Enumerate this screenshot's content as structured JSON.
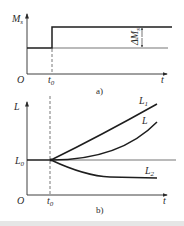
{
  "figure_a": {
    "caption": "a)",
    "y_label": "M",
    "y_label_sub": "s",
    "origin_label": "O",
    "x_tick_label": "t",
    "x_tick_sub": "0",
    "x_axis_label": "t",
    "delta_label": "ΔM",
    "delta_sub": "s"
  },
  "figure_b": {
    "caption": "b)",
    "y_label": "L",
    "origin_label": "O",
    "x_tick_label": "t",
    "x_tick_sub": "0",
    "x_axis_label": "t",
    "level_label": "L",
    "level_sub": "0",
    "curves": [
      {
        "label": "L",
        "sub": "1",
        "trend": "rising-fast"
      },
      {
        "label": "L",
        "sub": "",
        "trend": "rising-slow"
      },
      {
        "label": "L",
        "sub": "2",
        "trend": "falling-saturating"
      }
    ]
  },
  "colors": {
    "line": "#1e1e1e",
    "background": "#ffffff",
    "footer_band": "#e6e6e6"
  }
}
